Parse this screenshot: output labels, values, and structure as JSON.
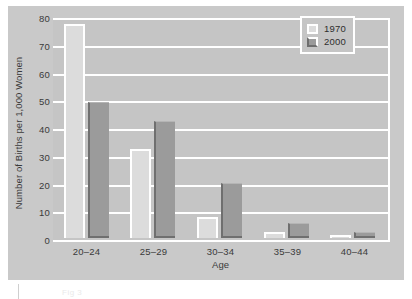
{
  "chart_data": {
    "type": "bar",
    "title": "",
    "subtitle": "",
    "xlabel": "Age",
    "ylabel": "Number of Births per 1,000 Women",
    "categories": [
      "20–24",
      "25–29",
      "30–34",
      "35–39",
      "40–44"
    ],
    "series": [
      {
        "name": "1970",
        "color": "#dcdcdc",
        "values": [
          77,
          32,
          7.5,
          2,
          1
        ]
      },
      {
        "name": "2000",
        "color": "#9b9b9b",
        "values": [
          49,
          42,
          20,
          5.5,
          2
        ]
      }
    ],
    "ylim": [
      0,
      80
    ],
    "yticks": [
      0,
      10,
      20,
      30,
      40,
      50,
      60,
      70,
      80
    ],
    "ytick_labels": [
      "0",
      "10",
      "20",
      "30",
      "40",
      "50",
      "60",
      "70",
      "80"
    ],
    "grid": true,
    "grid_axis": "y",
    "grid_color": "#ffffff",
    "legend_position": "top-right",
    "plot_background": "#c5c5c5",
    "figure_background": "#c9c9c9"
  },
  "legend": {
    "entries": [
      {
        "label": "1970"
      },
      {
        "label": "2000"
      }
    ]
  },
  "footer": {
    "artifact_text": "Fig 3"
  }
}
